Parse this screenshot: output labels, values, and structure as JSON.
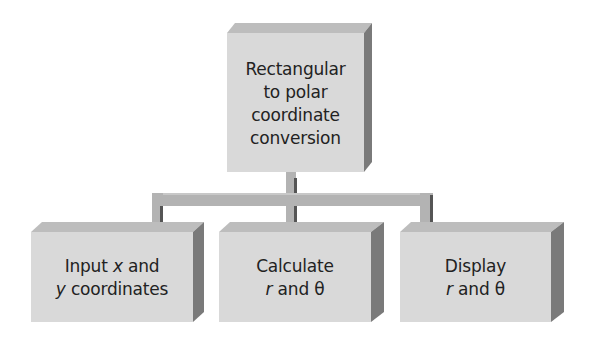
{
  "diagram": {
    "type": "hierarchy",
    "colors": {
      "front_face": "#d9d9d9",
      "top_face": "#bdbdbd",
      "side_face": "#7a7a7a",
      "connector_light": "#b3b3b3",
      "connector_dark": "#555555",
      "text": "#222222",
      "background": "#ffffff"
    },
    "root": {
      "lines": [
        "Rectangular",
        "to polar",
        "coordinate",
        "conversion"
      ]
    },
    "children": [
      {
        "line1": {
          "pre": "Input ",
          "var": "x",
          "post": " and"
        },
        "line2": {
          "pre": "",
          "var": "y",
          "post": " coordinates"
        }
      },
      {
        "line1": {
          "pre": "Calculate",
          "var": "",
          "post": ""
        },
        "line2": {
          "pre": "",
          "var": "r",
          "post": " and θ"
        }
      },
      {
        "line1": {
          "pre": "Display",
          "var": "",
          "post": ""
        },
        "line2": {
          "pre": "",
          "var": "r",
          "post": " and θ"
        }
      }
    ]
  }
}
